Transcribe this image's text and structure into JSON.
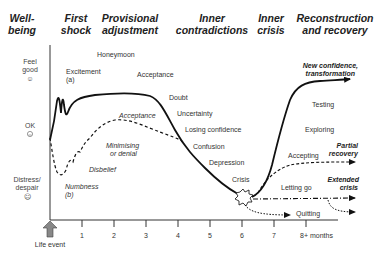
{
  "headers": {
    "wellbeing": [
      "Well-",
      "being"
    ],
    "first_shock": [
      "First",
      "shock"
    ],
    "provisional": [
      "Provisional",
      "adjustment"
    ],
    "inner_contradictions": [
      "Inner",
      "contradictions"
    ],
    "inner_crisis": [
      "Inner",
      "crisis"
    ],
    "reconstruction": [
      "Reconstruction",
      "and recovery"
    ]
  },
  "y_axis": {
    "feel_good": [
      "Feel",
      "good",
      "☺"
    ],
    "ok": [
      "OK",
      "😐"
    ],
    "distress": [
      "Distress/",
      "despair",
      "☹"
    ]
  },
  "x_axis": {
    "ticks": [
      "1",
      "2",
      "3",
      "4",
      "5",
      "6",
      "7",
      "8+ months"
    ],
    "origin_label": "Life event"
  },
  "upper_curve_labels": {
    "honeymoon": "Honeymoon",
    "excitement": "Excitement",
    "excitement_tag": "(a)",
    "acceptance": "Acceptance",
    "doubt": "Doubt",
    "uncertainty": "Uncertainty",
    "losing_confidence": "Losing confidence",
    "confusion": "Confusion",
    "depression": "Depression",
    "crisis": "Crisis"
  },
  "lower_curve_labels": {
    "acceptance": "Acceptance",
    "minimising": [
      "Minimising",
      "or denial"
    ],
    "disbelief": "Disbelief",
    "numbness": "Numbness",
    "numbness_tag": "(b)"
  },
  "recovery_labels": {
    "testing": "Testing",
    "exploring": "Exploring",
    "accepting": "Accepting",
    "letting_go": "Letting go",
    "quitting": "Quitting"
  },
  "outcomes": {
    "new_confidence": [
      "New confidence,",
      "transformation"
    ],
    "partial_recovery": [
      "Partial",
      "recovery"
    ],
    "extended_crisis": [
      "Extended",
      "crisis"
    ]
  },
  "colors": {
    "curve": "#111111",
    "arrow_fill": "#888888",
    "text": "#333333"
  }
}
